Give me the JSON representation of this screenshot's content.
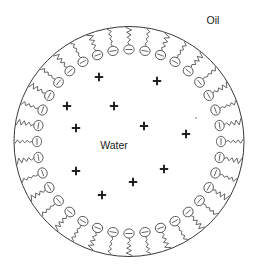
{
  "figure": {
    "type": "schematic-diagram",
    "canvas": {
      "width": 258,
      "height": 269,
      "background": "#ffffff"
    }
  },
  "labels": {
    "oil": "Oil",
    "water": "Water",
    "oil_position": {
      "x": 213,
      "y": 21
    },
    "water_position": {
      "x": 114,
      "y": 146
    }
  },
  "colors": {
    "boundary_stroke": "#3a3a3a",
    "surfactant_stroke": "#4a4a4a",
    "head_fill": "#ffffff",
    "ion_stroke": "#1a1a1a",
    "text": "#1a1a1a",
    "background": "#ffffff"
  },
  "droplet": {
    "center": {
      "x": 129,
      "y": 141.5
    },
    "radius": 115,
    "stroke_width": 1
  },
  "surfactant": {
    "count": 36,
    "head_charge": "−",
    "head_rx": 5.2,
    "head_ry": 4.6,
    "head_orbit_radius": 92,
    "tail_outer_radius": 114,
    "tail_segments": 7,
    "description": "anionic head group pointing into water, hydrocarbon tail extending into oil",
    "angles_deg": [
      -90,
      -80,
      -70,
      -60,
      -50,
      -40,
      -30,
      -20,
      -10,
      0,
      10,
      20,
      30,
      40,
      50,
      60,
      70,
      80,
      90,
      100,
      110,
      120,
      130,
      140,
      150,
      160,
      170,
      180,
      190,
      200,
      210,
      220,
      230,
      240,
      250,
      260
    ],
    "tail_jitter": [
      0.42,
      -0.55,
      0.61,
      -0.33,
      0.48,
      -0.62,
      0.29,
      -0.44,
      0.57,
      -0.38,
      0.5,
      -0.27,
      0.64,
      -0.51,
      0.36,
      -0.59,
      0.45,
      -0.31,
      0.53,
      -0.47,
      0.6,
      -0.35,
      0.41,
      -0.56,
      0.32,
      -0.63,
      0.49,
      -0.4,
      0.58,
      -0.29,
      0.46,
      -0.52,
      0.37,
      -0.6,
      0.54,
      -0.43
    ]
  },
  "counter_ions": {
    "charge": "+",
    "count": 12,
    "arm": 4.2,
    "positions": [
      {
        "x": 99,
        "y": 77
      },
      {
        "x": 157,
        "y": 81
      },
      {
        "x": 67,
        "y": 106
      },
      {
        "x": 114,
        "y": 106
      },
      {
        "x": 76,
        "y": 128
      },
      {
        "x": 144,
        "y": 126
      },
      {
        "x": 186,
        "y": 134
      },
      {
        "x": 76,
        "y": 171
      },
      {
        "x": 164,
        "y": 169
      },
      {
        "x": 133,
        "y": 182
      },
      {
        "x": 102,
        "y": 195
      },
      {
        "x": 186,
        "y": 134
      }
    ]
  },
  "specks": [
    {
      "x": 196,
      "y": 118,
      "r": 0.9
    }
  ]
}
